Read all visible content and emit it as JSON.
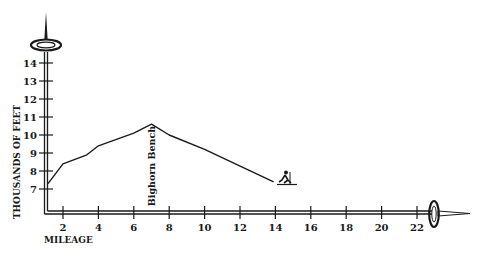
{
  "chart_data": {
    "type": "line",
    "title": "",
    "xlabel": "MILEAGE",
    "ylabel": "THOUSANDS OF FEET",
    "x_ticks": [
      2,
      4,
      6,
      8,
      10,
      12,
      14,
      16,
      18,
      20,
      22
    ],
    "y_ticks": [
      7,
      8,
      9,
      10,
      11,
      12,
      13,
      14
    ],
    "xlim": [
      0.5,
      23
    ],
    "ylim": [
      6,
      15
    ],
    "grid": false,
    "legend": null,
    "series": [
      {
        "name": "Elevation profile",
        "x": [
          1.15,
          2.0,
          3.35,
          4.0,
          6.0,
          7.0,
          8.0,
          10.0,
          13.9
        ],
        "y": [
          7.3,
          8.4,
          8.9,
          9.4,
          10.1,
          10.6,
          10.0,
          9.2,
          7.4
        ]
      }
    ],
    "annotations": [
      {
        "text": "Bighorn Bench",
        "x": 7.0,
        "orientation": "vertical"
      }
    ],
    "decorations": [
      "ski-pole-y-axis",
      "ski-pole-x-axis",
      "skier-icon-at-end"
    ]
  },
  "colors": {
    "ink": "#1a1a1a",
    "background": "#ffffff"
  }
}
